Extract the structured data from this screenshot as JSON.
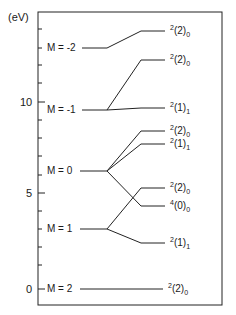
{
  "axis": {
    "unit": "(eV)",
    "ticks": [
      {
        "label": "10",
        "value": 10
      },
      {
        "label": "5",
        "value": 5
      },
      {
        "label": "0",
        "value": 0
      }
    ],
    "ylim": [
      -1,
      13.5
    ]
  },
  "left_levels": [
    {
      "label": "M = -2",
      "energy": 13.5
    },
    {
      "label": "M = -1",
      "energy": 10.1
    },
    {
      "label": "M = 0",
      "energy": 6.6
    },
    {
      "label": "M = 1",
      "energy": 3.5
    },
    {
      "label": "M = 2",
      "energy": 0
    }
  ],
  "right_levels": [
    {
      "sup": "2",
      "main": "(2)",
      "sub": "0",
      "energy": 14.4,
      "from": "M = -2"
    },
    {
      "sup": "2",
      "main": "(2)",
      "sub": "0",
      "energy": 12.8,
      "from": "M = -1"
    },
    {
      "sup": "2",
      "main": "(1)",
      "sub": "1",
      "energy": 10.2,
      "from": "M = -1"
    },
    {
      "sup": "2",
      "main": "(2)",
      "sub": "0",
      "energy": 8.9,
      "from": "M = 0"
    },
    {
      "sup": "2",
      "main": "(1)",
      "sub": "1",
      "energy": 8.2,
      "from": "M = 0"
    },
    {
      "sup": "2",
      "main": "(2)",
      "sub": "0",
      "energy": 6.2,
      "from": "M = 1"
    },
    {
      "sup": "4",
      "main": "(0)",
      "sub": "0",
      "energy": 5.2,
      "from": "M = 0"
    },
    {
      "sup": "2",
      "main": "(1)",
      "sub": "1",
      "energy": 2.5,
      "from": "M = 1"
    },
    {
      "sup": "2",
      "main": "(2)",
      "sub": "0",
      "energy": 0,
      "from": "M = 2"
    }
  ]
}
